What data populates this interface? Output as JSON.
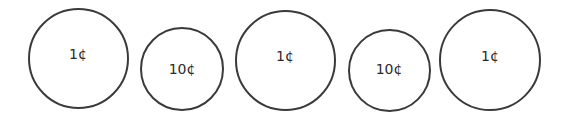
{
  "coins": [
    {
      "label": "1¢",
      "cx": 78,
      "cy": 58,
      "d": 101,
      "label_dy": -4
    },
    {
      "label": "10¢",
      "cx": 182,
      "cy": 69,
      "d": 84,
      "label_dy": 0
    },
    {
      "label": "1¢",
      "cx": 285,
      "cy": 60,
      "d": 101,
      "label_dy": -4
    },
    {
      "label": "10¢",
      "cx": 389,
      "cy": 70,
      "d": 83,
      "label_dy": -1
    },
    {
      "label": "1¢",
      "cx": 490,
      "cy": 60,
      "d": 102,
      "label_dy": -4
    }
  ],
  "colors": {
    "stroke": "#3a3a3a",
    "text": "#2a2a2a",
    "background": "#ffffff"
  }
}
